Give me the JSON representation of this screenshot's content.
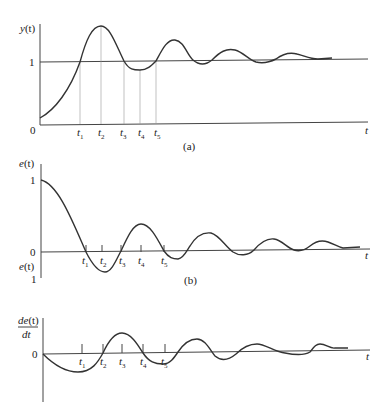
{
  "figure": {
    "panels": [
      {
        "id": "a",
        "caption": "(a)",
        "y_label": "y(t)",
        "x_label": "t",
        "ticks_y": [
          "0",
          "1"
        ],
        "ticks_x": [
          "t1",
          "t2",
          "t3",
          "t4",
          "t5"
        ]
      },
      {
        "id": "b",
        "caption": "(b)",
        "y_label": "e(t)",
        "y_label_lower": "e(t)",
        "x_label": "t",
        "ticks_y": [
          "1",
          "0",
          "1"
        ],
        "ticks_x": [
          "t1",
          "t2",
          "t3",
          "t4",
          "t5"
        ]
      },
      {
        "id": "c",
        "caption": "",
        "y_label_num": "de(t)",
        "y_label_den": "dt",
        "x_label": "t",
        "ticks_y": [
          "0"
        ],
        "ticks_x": [
          "t1",
          "t2",
          "t3",
          "t4",
          "t5"
        ]
      }
    ]
  },
  "labels": {
    "a_y": "y",
    "a_paren": "(t)",
    "a_one": "1",
    "a_zero": "0",
    "a_t": "t",
    "a_cap": "(a)",
    "b_y": "e",
    "b_paren": "(t)",
    "b_one": "1",
    "b_zero": "0",
    "b_ylow": "e",
    "b_ylow_paren": "(t)",
    "b_one_low": "1",
    "b_t": "t",
    "b_cap": "(b)",
    "c_num": "de",
    "c_num_paren": "(t)",
    "c_den": "dt",
    "c_zero": "0",
    "c_t": "t",
    "t": "t",
    "s1": "1",
    "s2": "2",
    "s3": "3",
    "s4": "4",
    "s5": "5"
  }
}
